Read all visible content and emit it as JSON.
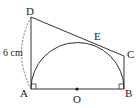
{
  "diagram": {
    "type": "geometry",
    "points": {
      "A": {
        "label": "A"
      },
      "B": {
        "label": "B"
      },
      "C": {
        "label": "C"
      },
      "D": {
        "label": "D"
      },
      "E": {
        "label": "E"
      },
      "O": {
        "label": "O"
      }
    },
    "measurement": {
      "segment": "AD",
      "label": "6 cm"
    },
    "right_angles": [
      "A",
      "B"
    ],
    "colors": {
      "stroke": "#333333",
      "background": "#ffffff"
    }
  }
}
